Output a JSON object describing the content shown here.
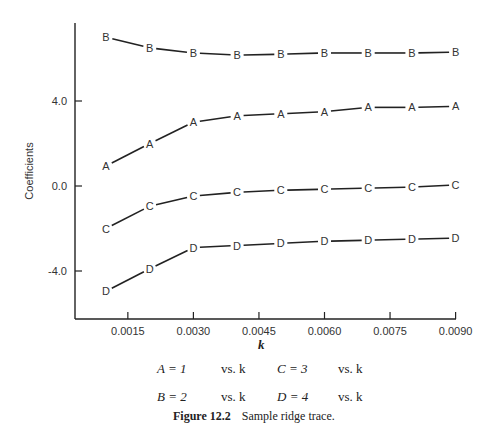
{
  "chart_data": {
    "type": "line",
    "title": "Sample ridge trace.",
    "figure_label": "Figure 12.2",
    "xlabel": "k",
    "ylabel": "Coefficients",
    "x": [
      0.001,
      0.002,
      0.003,
      0.004,
      0.005,
      0.006,
      0.007,
      0.008,
      0.009
    ],
    "xticks": [
      "0.0015",
      "0.0030",
      "0.0045",
      "0.0060",
      "0.0075",
      "0.0090"
    ],
    "xtick_values": [
      0.0015,
      0.003,
      0.0045,
      0.006,
      0.0075,
      0.009
    ],
    "yticks": [
      "4.0",
      "0.0",
      "-4.0"
    ],
    "ytick_values": [
      4.0,
      0.0,
      -4.0
    ],
    "xlim": [
      0.00045,
      0.009
    ],
    "ylim": [
      -6.3,
      7.8
    ],
    "grid": false,
    "series": [
      {
        "name": "B",
        "marker": "B",
        "values": [
          7.0,
          6.5,
          6.26,
          6.16,
          6.2,
          6.26,
          6.26,
          6.26,
          6.3
        ]
      },
      {
        "name": "A",
        "marker": "A",
        "values": [
          0.94,
          2.0,
          3.0,
          3.3,
          3.4,
          3.5,
          3.7,
          3.7,
          3.75
        ]
      },
      {
        "name": "C",
        "marker": "C",
        "values": [
          -2.0,
          -0.95,
          -0.47,
          -0.3,
          -0.2,
          -0.15,
          -0.1,
          -0.05,
          0.05
        ]
      },
      {
        "name": "D",
        "marker": "D",
        "values": [
          -4.95,
          -3.9,
          -2.9,
          -2.8,
          -2.7,
          -2.6,
          -2.55,
          -2.5,
          -2.45
        ]
      }
    ],
    "legend": [
      {
        "key": "A = 1",
        "vs": "vs. k"
      },
      {
        "key": "C = 3",
        "vs": "vs. k"
      },
      {
        "key": "B = 2",
        "vs": "vs. k"
      },
      {
        "key": "D = 4",
        "vs": "vs. k"
      }
    ]
  },
  "caption": {
    "label": "Figure 12.2",
    "text": "Sample ridge trace."
  },
  "legend_rows": [
    {
      "left_key": "A = 1",
      "left_vs": "vs. k",
      "right_key": "C = 3",
      "right_vs": "vs. k"
    },
    {
      "left_key": "B = 2",
      "left_vs": "vs. k",
      "right_key": "D = 4",
      "right_vs": "vs. k"
    }
  ],
  "axis": {
    "xlabel": "k",
    "ylabel": "Coefficients"
  }
}
